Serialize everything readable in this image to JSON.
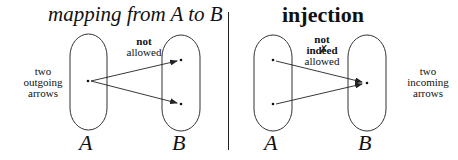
{
  "left_panel": {
    "title": "mapping from A to B",
    "set_a_label": "A",
    "set_b_label": "B",
    "annotation_bold": "not",
    "annotation_normal": "allowed",
    "side_note": [
      "two",
      "outgoing",
      "arrows"
    ]
  },
  "right_panel": {
    "title": "injection",
    "set_a_label": "A",
    "set_b_label": "B",
    "annotation_bold": "not",
    "annotation_middle": "indeed",
    "annotation_normal": "allowed",
    "strike_mark": "✗",
    "side_note": [
      "two",
      "incoming",
      "arrows"
    ]
  },
  "colors": {
    "stroke": "#222222",
    "background": "#ffffff"
  }
}
